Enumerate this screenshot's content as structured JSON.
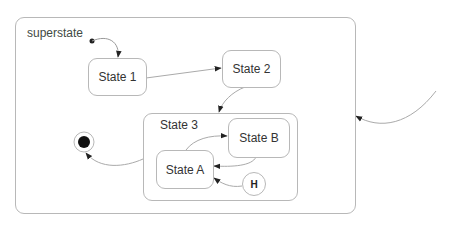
{
  "diagram": {
    "type": "UML state machine",
    "superstate": {
      "label": "superstate"
    },
    "states": [
      {
        "id": "s1",
        "label": "State 1"
      },
      {
        "id": "s2",
        "label": "State 2"
      },
      {
        "id": "s3",
        "label": "State 3"
      },
      {
        "id": "sA",
        "label": "State A"
      },
      {
        "id": "sB",
        "label": "State B"
      }
    ],
    "history": {
      "label": "H"
    },
    "pseudostates": [
      "initial",
      "final"
    ],
    "transitions": [
      {
        "from": "initial",
        "to": "State 1"
      },
      {
        "from": "State 1",
        "to": "State 2"
      },
      {
        "from": "State 2",
        "to": "State 3"
      },
      {
        "from": "State A",
        "to": "State B"
      },
      {
        "from": "State B",
        "to": "State A"
      },
      {
        "from": "H",
        "to": "State A"
      },
      {
        "from": "State 3",
        "to": "final"
      },
      {
        "from": "external",
        "to": "superstate"
      }
    ],
    "colors": {
      "line": "#b8b8b8",
      "arrow": "#222222",
      "text": "#333333",
      "background": "#ffffff"
    }
  }
}
